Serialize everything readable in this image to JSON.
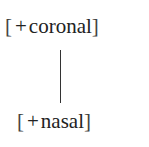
{
  "diagram": {
    "type": "feature-geometry",
    "nodes": [
      {
        "id": "top",
        "open": "[",
        "sign": "+",
        "feature": "coronal",
        "close": "]"
      },
      {
        "id": "bottom",
        "open": "[",
        "sign": "+",
        "feature": "nasal",
        "close": "]"
      }
    ],
    "edges": [
      {
        "from": "top",
        "to": "bottom"
      }
    ],
    "line_color": "#333333",
    "text_color": "#222222"
  }
}
